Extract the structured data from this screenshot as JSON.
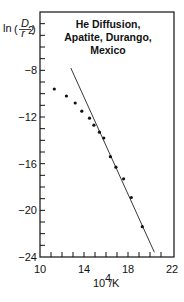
{
  "chart_data": {
    "type": "scatter",
    "title": "He Diffusion, Apatite, Durango, Mexico",
    "title_lines": [
      "He Diffusion,",
      "Apatite, Durango,",
      "Mexico"
    ],
    "xlabel": "10^4/K",
    "ylabel": "ln(D/r^2)",
    "xlim": [
      10,
      22
    ],
    "ylim": [
      -24,
      -3
    ],
    "x_ticks": [
      10,
      14,
      18,
      22
    ],
    "y_ticks": [
      -8,
      -12,
      -16,
      -20,
      -24
    ],
    "x_minor_step": 1,
    "y_minor_step": 1,
    "grid": false,
    "legend": null,
    "series": [
      {
        "name": "measured",
        "type": "scatter",
        "x": [
          11.3,
          12.4,
          13.2,
          13.8,
          14.5,
          14.9,
          15.4,
          15.8,
          16.4,
          16.9,
          17.6,
          18.3,
          19.3
        ],
        "y": [
          -9.6,
          -10.2,
          -10.8,
          -11.5,
          -12.1,
          -12.7,
          -13.3,
          -13.8,
          -15.4,
          -16.3,
          -17.3,
          -18.9,
          -21.4
        ]
      },
      {
        "name": "linear fit",
        "type": "line",
        "x": [
          12.8,
          20.4
        ],
        "y": [
          -7.8,
          -23.6
        ]
      }
    ]
  },
  "labels": {
    "ylabel_prefix": "ln",
    "ylabel_num": "D",
    "ylabel_den": "r",
    "ylabel_den_sup": "2",
    "xlabel_base": "10",
    "xlabel_sup": "4",
    "xlabel_suffix": "/K",
    "x_tick_labels": [
      "10",
      "14",
      "18",
      "22"
    ],
    "y_tick_labels": [
      "-8",
      "-12",
      "-16",
      "-20",
      "-24"
    ]
  }
}
